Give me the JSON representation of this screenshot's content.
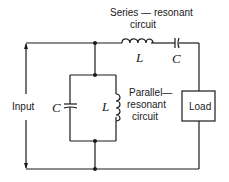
{
  "diagram": {
    "type": "circuit-schematic",
    "labels": {
      "series_title_line1": "Series — resonant",
      "series_title_line2": "circuit",
      "parallel_title_line1": "Parallel—",
      "parallel_title_line2": "resonant",
      "parallel_title_line3": "circuit",
      "input": "Input",
      "load": "Load",
      "series_inductor": "L",
      "series_capacitor": "C",
      "parallel_capacitor": "C",
      "parallel_inductor": "L"
    },
    "components": [
      {
        "id": "series-inductor",
        "kind": "inductor",
        "label": "L",
        "group": "series-resonant circuit"
      },
      {
        "id": "series-capacitor",
        "kind": "capacitor",
        "label": "C",
        "group": "series-resonant circuit"
      },
      {
        "id": "parallel-capacitor",
        "kind": "capacitor",
        "label": "C",
        "group": "parallel-resonant circuit"
      },
      {
        "id": "parallel-inductor",
        "kind": "inductor",
        "label": "L",
        "group": "parallel-resonant circuit"
      },
      {
        "id": "load",
        "kind": "resistor-box",
        "label": "Load"
      },
      {
        "id": "input",
        "kind": "source-arrows",
        "label": "Input"
      }
    ],
    "colors": {
      "ink": "#1a1a1a",
      "background": "#ffffff"
    }
  }
}
